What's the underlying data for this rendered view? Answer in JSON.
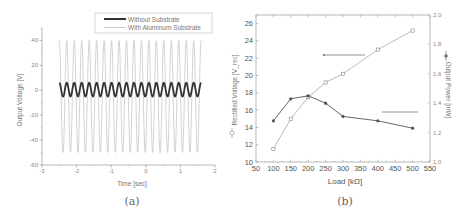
{
  "panels": {
    "a": {
      "caption": "(a)"
    },
    "b": {
      "caption": "(b)"
    }
  },
  "chart_data": [
    {
      "type": "line",
      "panel": "(a)",
      "title": "",
      "xlabel": "Time [sec]",
      "ylabel": "Output Voltage [V]",
      "xlim": [
        -3,
        2
      ],
      "ylim": [
        -60,
        50
      ],
      "xticks": [
        -3,
        -2,
        -1,
        0,
        1,
        2
      ],
      "yticks": [
        -60,
        -40,
        -20,
        0,
        20,
        40
      ],
      "grid": false,
      "legend_position": "top-right",
      "series": [
        {
          "name": "Without Substrate",
          "color": "#333333",
          "description": "sinusoid ~19 cycles from t=-2.5 to 1.6 s",
          "t_range": [
            -2.5,
            1.6
          ],
          "cycles": 19,
          "max": 6,
          "min": -5
        },
        {
          "name": "With Aluminum Substrate",
          "color": "#c8c8c8",
          "description": "sinusoid ~19 cycles from t=-2.5 to 1.6 s",
          "t_range": [
            -2.5,
            1.6
          ],
          "cycles": 19,
          "max": 40,
          "min": -50
        }
      ]
    },
    {
      "type": "line",
      "panel": "(b)",
      "title": "",
      "xlabel": "Load [kΩ]",
      "ylabel": "Rectified Voltage [V_rec]",
      "y2label": "Output Power [mW]",
      "xlim": [
        50,
        550
      ],
      "ylim": [
        10,
        27
      ],
      "y2lim": [
        1.0,
        2.0
      ],
      "xticks": [
        50,
        100,
        150,
        200,
        250,
        300,
        350,
        400,
        450,
        500,
        550
      ],
      "yticks": [
        10,
        12,
        14,
        16,
        18,
        20,
        22,
        24,
        26
      ],
      "y2ticks": [
        1.0,
        1.2,
        1.4,
        1.6,
        1.8,
        2.0
      ],
      "grid": false,
      "categories": [
        100,
        150,
        200,
        250,
        300,
        400,
        500
      ],
      "series": [
        {
          "name": "Rectified Voltage",
          "axis": "left",
          "marker": "open-square",
          "color": "#aaaaaa",
          "values": [
            11.5,
            15.0,
            17.5,
            19.2,
            20.2,
            23.0,
            25.2
          ]
        },
        {
          "name": "Output Power",
          "axis": "right",
          "marker": "filled-circle",
          "color": "#666666",
          "values": [
            1.28,
            1.43,
            1.45,
            1.4,
            1.31,
            1.28,
            1.23
          ]
        }
      ],
      "annotations": [
        {
          "type": "arrow-left",
          "points_to": "left axis",
          "near_series": "Rectified Voltage"
        },
        {
          "type": "arrow-right",
          "points_to": "right axis",
          "near_series": "Output Power"
        }
      ]
    }
  ]
}
